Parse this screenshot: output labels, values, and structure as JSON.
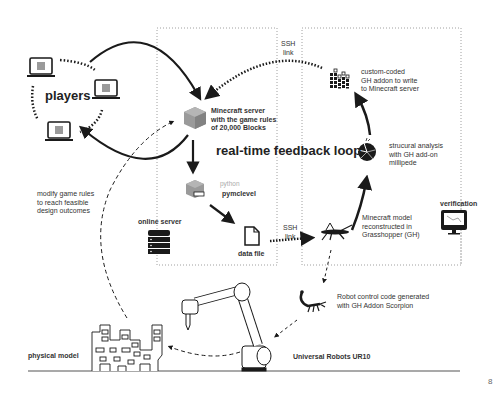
{
  "title": "real-time feedback loop",
  "page_number": "8",
  "nodes": {
    "players": {
      "label": "players"
    },
    "minecraft_server": {
      "label_lines": [
        "Minecraft server",
        "with the game rules",
        "of 20,000 Blocks"
      ]
    },
    "pymclevel": {
      "python_label": "python",
      "label": "pymclevel"
    },
    "online_server": {
      "label": "online server"
    },
    "data_file": {
      "label": "data file"
    },
    "ssh_link_top": {
      "label_lines": [
        "SSH",
        "link"
      ]
    },
    "ssh_link_bottom": {
      "label_lines": [
        "SSH",
        "link"
      ]
    },
    "custom_addon": {
      "label_lines": [
        "custom-coded",
        "GH addon to write",
        "to Minecraft server"
      ]
    },
    "structural_analysis": {
      "label_lines": [
        "strucural analysis",
        "with GH add-on",
        "millipede"
      ]
    },
    "grasshopper_model": {
      "label_lines": [
        "Minecraft model",
        "reconstructed in",
        "Grasshopper (GH)"
      ]
    },
    "verification": {
      "label": "verification"
    },
    "scorpion": {
      "label_lines": [
        "Robot control code generated",
        "with GH Addon Scorpion"
      ]
    },
    "robot": {
      "label": "Universal Robots UR10"
    },
    "physical_model": {
      "label": "physical model"
    },
    "modify_rules": {
      "label_lines": [
        "modify game rules",
        "to reach feasible",
        "design outcomes"
      ]
    }
  },
  "colors": {
    "ink": "#1a1a1a",
    "text": "#333333",
    "block": "#9a9a9a",
    "dotted_box": "#888888"
  }
}
